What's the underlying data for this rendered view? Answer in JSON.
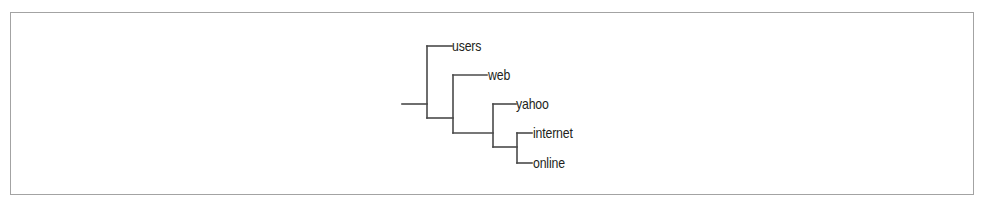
{
  "diagram": {
    "type": "dendrogram",
    "orientation": "left-to-right",
    "colors": {
      "frame": "#a3a3a3",
      "edges": "#4a4a4a",
      "text": "#231f20",
      "background": "#ffffff"
    },
    "leaves": [
      {
        "label": "users"
      },
      {
        "label": "web"
      },
      {
        "label": "yahoo"
      },
      {
        "label": "internet"
      },
      {
        "label": "online"
      }
    ],
    "structure": "(users, (web, (yahoo, (internet, online))))"
  }
}
